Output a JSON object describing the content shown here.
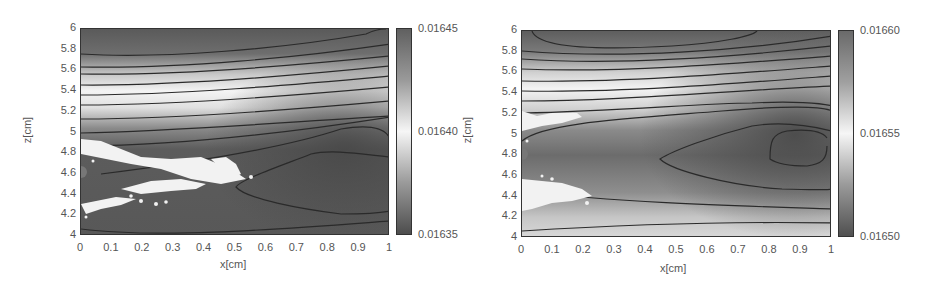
{
  "chart_data": [
    {
      "type": "heatmap",
      "title": "",
      "xlabel": "x[cm]",
      "ylabel": "z[cm]",
      "xlim": [
        0,
        1
      ],
      "ylim": [
        4,
        6
      ],
      "x_ticks": [
        "0",
        "0.1",
        "0.2",
        "0.3",
        "0.4",
        "0.5",
        "0.6",
        "0.7",
        "0.8",
        "0.9",
        "1"
      ],
      "y_ticks": [
        "4",
        "4.2",
        "4.4",
        "4.6",
        "4.8",
        "5",
        "5.2",
        "5.4",
        "5.6",
        "5.8",
        "6"
      ],
      "colorbar": {
        "min": 0.01635,
        "max": 0.01645,
        "ticks": [
          "0.01635",
          "0.01640",
          "0.01645"
        ],
        "colormap": "gray (dark=min, light=mid, dark=max)"
      },
      "contours": "horizontal bands of isolines concentrated near z=5.2–5.9; closed low-value lobe from x≈0.53 to x=1 centered near z≈4.75",
      "annotations": [
        "white particle cluster from x=0 to x≈0.5 near z≈4.5–4.85",
        "gray marker dot at x=0, z≈4.6"
      ]
    },
    {
      "type": "heatmap",
      "title": "",
      "xlabel": "x[cm]",
      "ylabel": "z[cm]",
      "xlim": [
        0,
        1
      ],
      "ylim": [
        4,
        6
      ],
      "x_ticks": [
        "0",
        "0.1",
        "0.2",
        "0.3",
        "0.4",
        "0.5",
        "0.6",
        "0.7",
        "0.8",
        "0.9",
        "1"
      ],
      "y_ticks": [
        "4",
        "4.2",
        "4.4",
        "4.6",
        "4.8",
        "5",
        "5.2",
        "5.4",
        "5.6",
        "5.8",
        "6"
      ],
      "colorbar": {
        "min": 0.0165,
        "max": 0.0166,
        "ticks": [
          "0.01650",
          "0.01655",
          "0.01660"
        ],
        "colormap": "gray (dark=min, light=mid, dark=max)"
      },
      "contours": "horizontal isolines near z=5.3–5.9; nested closed lobes opening toward x=1 centered near z≈4.85 (outer from x≈0.44, inner from x≈0.8)",
      "annotations": [
        "white particle clusters at x=0–0.2 near z≈5.1–5.2 and z≈4.3–4.55",
        "gray marker dot at x=0, z≈4.8"
      ]
    }
  ],
  "left": {
    "xlabel": "x[cm]",
    "ylabel": "z[cm]",
    "x_ticks": [
      "0",
      "0.1",
      "0.2",
      "0.3",
      "0.4",
      "0.5",
      "0.6",
      "0.7",
      "0.8",
      "0.9",
      "1"
    ],
    "y_ticks": [
      "4",
      "4.2",
      "4.4",
      "4.6",
      "4.8",
      "5",
      "5.2",
      "5.4",
      "5.6",
      "5.8",
      "6"
    ],
    "cb_ticks": [
      "0.01645",
      "0.01640",
      "0.01635"
    ]
  },
  "right": {
    "xlabel": "x[cm]",
    "ylabel": "z[cm]",
    "x_ticks": [
      "0",
      "0.1",
      "0.2",
      "0.3",
      "0.4",
      "0.5",
      "0.6",
      "0.7",
      "0.8",
      "0.9",
      "1"
    ],
    "y_ticks": [
      "4",
      "4.2",
      "4.4",
      "4.6",
      "4.8",
      "5",
      "5.2",
      "5.4",
      "5.6",
      "5.8",
      "6"
    ],
    "cb_ticks": [
      "0.01660",
      "0.01655",
      "0.01650"
    ]
  },
  "colors": {
    "dark": "#4a4a4a",
    "mid": "#8a8a8a",
    "light": "#f2f2f2",
    "contour": "#2a2a2a",
    "marker": "#777777"
  }
}
